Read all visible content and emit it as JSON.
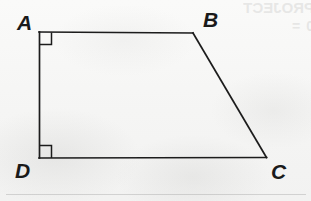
{
  "figure": {
    "name": "quadrilateral-ABCD",
    "shape_type": "trapezoid",
    "stroke_color": "#1c1c1c",
    "stroke_width": 1.6,
    "background_color": "#f7f7f6",
    "vertices": [
      {
        "id": "A",
        "label": "A",
        "x": 39,
        "y": 32,
        "label_x": 17,
        "label_y": 12,
        "right_angle": true
      },
      {
        "id": "B",
        "label": "B",
        "x": 193,
        "y": 33,
        "label_x": 203,
        "label_y": 9,
        "right_angle": false
      },
      {
        "id": "C",
        "label": "C",
        "x": 266,
        "y": 157,
        "label_x": 271,
        "label_y": 161,
        "right_angle": false
      },
      {
        "id": "D",
        "label": "D",
        "x": 39,
        "y": 158,
        "label_x": 15,
        "label_y": 160,
        "right_angle": true
      }
    ],
    "edges": [
      {
        "id": "AB",
        "from": "A",
        "to": "B"
      },
      {
        "id": "BC",
        "from": "B",
        "to": "C"
      },
      {
        "id": "CD",
        "from": "C",
        "to": "D"
      },
      {
        "id": "DA",
        "from": "D",
        "to": "A"
      }
    ],
    "right_angle_markers": [
      {
        "at": "A",
        "size": 12,
        "path": "M 39 44 L 51 44 L 51 32"
      },
      {
        "at": "D",
        "size": 12,
        "path": "M 39 146 L 51 146 L 51 158"
      }
    ],
    "outline_path": "M 39 32 L 193 33 L 266 157 L 39 158 Z"
  },
  "labels": {
    "A": "A",
    "B": "B",
    "C": "C",
    "D": "D"
  },
  "artifacts": {
    "bleed_through_line_1": "PROJECT",
    "bleed_through_line_2": "0  =",
    "faint_rule_visible": true
  }
}
